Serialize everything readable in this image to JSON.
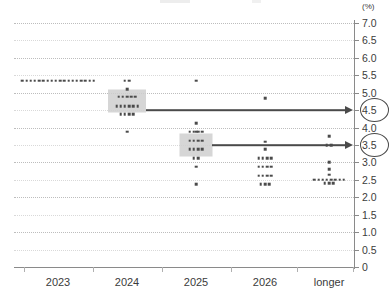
{
  "chart_data": {
    "type": "scatter",
    "title": "",
    "subtitle": "",
    "xlabel": "",
    "ylabel": "",
    "unit_label": "(%)",
    "ylim": [
      0,
      7.0
    ],
    "ytick_labels": [
      "7.0",
      "6.5",
      "6.0",
      "5.5",
      "5.0",
      "4.5",
      "4.0",
      "3.5",
      "3.0",
      "2.5",
      "2.0",
      "1.5",
      "1.0",
      "0.5",
      "0"
    ],
    "ytick_values": [
      7.0,
      6.5,
      6.0,
      5.5,
      5.0,
      4.5,
      4.0,
      3.5,
      3.0,
      2.5,
      2.0,
      1.5,
      1.0,
      0.5,
      0
    ],
    "categories": [
      "2023",
      "2024",
      "2025",
      "2026",
      "longer"
    ],
    "grid": true,
    "legend": false,
    "series": [
      {
        "name": "2023",
        "category": "2023",
        "points": [
          {
            "value": 5.35,
            "count": 18
          }
        ]
      },
      {
        "name": "2024",
        "category": "2024",
        "points": [
          {
            "value": 5.35,
            "count": 2
          },
          {
            "value": 5.1,
            "count": 1
          },
          {
            "value": 4.88,
            "count": 5
          },
          {
            "value": 4.62,
            "count": 6
          },
          {
            "value": 4.38,
            "count": 4
          },
          {
            "value": 3.88,
            "count": 1
          }
        ]
      },
      {
        "name": "2025",
        "category": "2025",
        "points": [
          {
            "value": 5.35,
            "count": 1
          },
          {
            "value": 4.12,
            "count": 1
          },
          {
            "value": 3.88,
            "count": 1
          },
          {
            "value": 3.88,
            "count": 4
          },
          {
            "value": 3.62,
            "count": 4
          },
          {
            "value": 3.38,
            "count": 4
          },
          {
            "value": 3.12,
            "count": 2
          },
          {
            "value": 2.88,
            "count": 1
          },
          {
            "value": 2.38,
            "count": 1
          }
        ]
      },
      {
        "name": "2026",
        "category": "2026",
        "points": [
          {
            "value": 4.85,
            "count": 1
          },
          {
            "value": 3.6,
            "count": 1
          },
          {
            "value": 3.38,
            "count": 1
          },
          {
            "value": 3.12,
            "count": 4
          },
          {
            "value": 2.88,
            "count": 4
          },
          {
            "value": 2.62,
            "count": 4
          },
          {
            "value": 2.38,
            "count": 3
          }
        ]
      },
      {
        "name": "longer",
        "category": "longer",
        "points": [
          {
            "value": 3.75,
            "count": 1
          },
          {
            "value": 3.5,
            "count": 2
          },
          {
            "value": 3.0,
            "count": 1
          },
          {
            "value": 2.8,
            "count": 1
          },
          {
            "value": 2.65,
            "count": 1
          },
          {
            "value": 2.5,
            "count": 8
          },
          {
            "value": 2.4,
            "count": 3
          }
        ]
      }
    ],
    "highlights": [
      {
        "category": "2024",
        "value": 4.62,
        "label": "4.5"
      },
      {
        "category": "2025",
        "value": 3.5,
        "label": "3.5"
      }
    ],
    "annotations": [
      {
        "name": "median-2024",
        "value": "4.5",
        "from_category": "2024"
      },
      {
        "name": "median-2025",
        "value": "3.5",
        "from_category": "2025"
      }
    ]
  }
}
